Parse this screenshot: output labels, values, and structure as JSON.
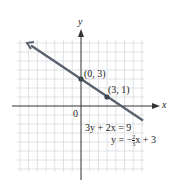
{
  "graph": {
    "axis_x_label": "x",
    "axis_y_label": "y",
    "origin_label": "0",
    "points": [
      {
        "label": "(0, 3)",
        "x": 0,
        "y": 3
      },
      {
        "label": "(3, 1)",
        "x": 3,
        "y": 1
      }
    ],
    "equation_standard": "3y + 2x = 9",
    "equation_slope_prefix": "y = −",
    "equation_slope_num": "2",
    "equation_slope_den": "3",
    "equation_slope_suffix": "x + 3",
    "line_color": "#5a6270",
    "grid_color": "#d6d9dd"
  }
}
